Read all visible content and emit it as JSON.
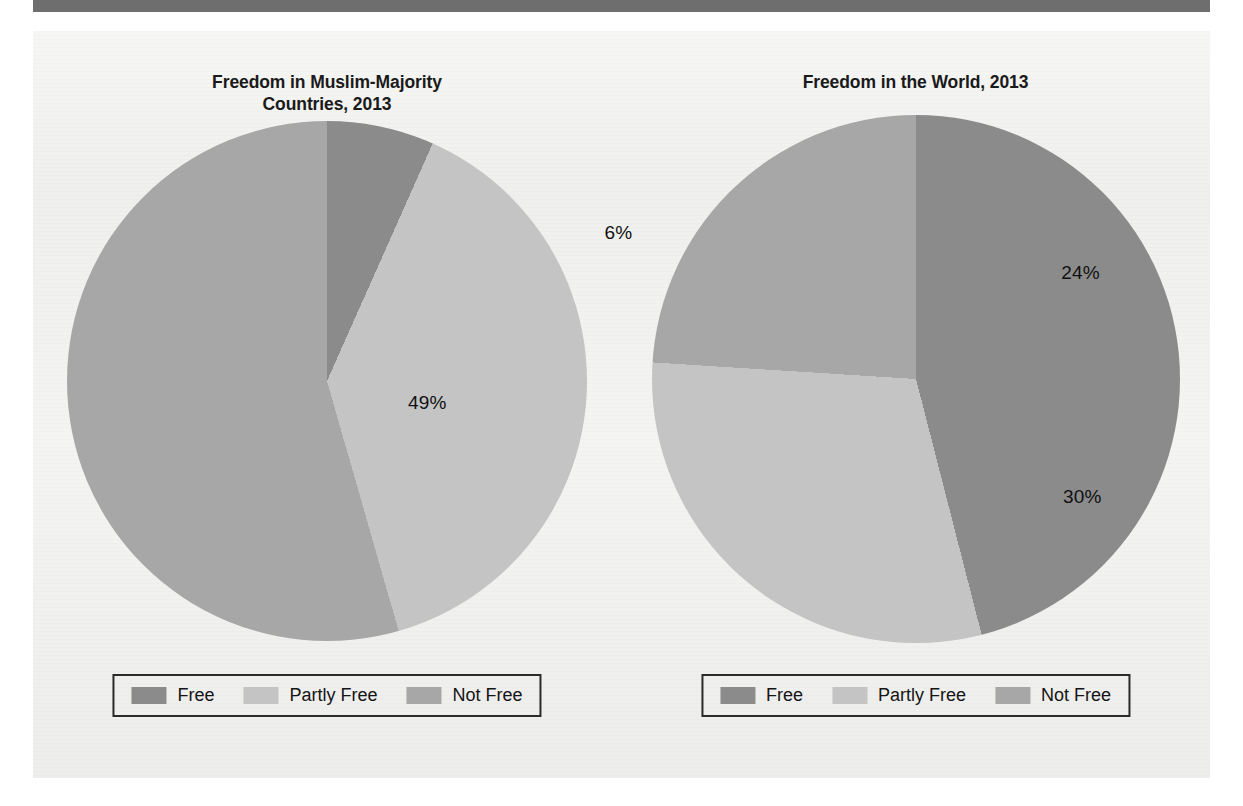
{
  "page": {
    "background_color": "#ffffff",
    "panel_color": "#f2f2f0",
    "top_rule_color": "#6e6e6e"
  },
  "palette": {
    "free": "#8b8b8b",
    "partly_free": "#c4c4c4",
    "not_free": "#a7a7a7",
    "label_text": "#111111",
    "title_text": "#1a1a1a",
    "legend_border": "#2a2a2a"
  },
  "legend": {
    "items": [
      {
        "label": "Free",
        "color": "#8b8b8b",
        "key": "free"
      },
      {
        "label": "Partly Free",
        "color": "#c4c4c4",
        "key": "partly_free"
      },
      {
        "label": "Not Free",
        "color": "#a7a7a7",
        "key": "not_free"
      }
    ]
  },
  "charts": [
    {
      "id": "muslim-majority",
      "title": "Freedom in Muslim-Majority Countries, 2013",
      "title_line1": "Freedom in Muslim-Majority",
      "title_line2": "Countries, 2013",
      "labels": {
        "free": "6%",
        "partly_free": "35%",
        "not_free": "49%"
      }
    },
    {
      "id": "world",
      "title": "Freedom in the World, 2013",
      "title_line1": "Freedom in the World, 2013",
      "title_line2": "",
      "labels": {
        "free": "46%",
        "partly_free": "30%",
        "not_free": "24%"
      }
    }
  ],
  "chart_data": [
    {
      "type": "pie",
      "title": "Freedom in Muslim-Majority Countries, 2013",
      "categories": [
        "Free",
        "Partly Free",
        "Not Free"
      ],
      "values": [
        6,
        35,
        49
      ],
      "value_labels": [
        "6%",
        "35%",
        "49%"
      ],
      "unit": "percent",
      "colors": [
        "#8b8b8b",
        "#c4c4c4",
        "#a7a7a7"
      ],
      "start_angle_deg": 0,
      "direction": "clockwise",
      "legend": "bottom",
      "note": "Percentages as printed sum to 90%; remaining share unlabeled in source figure."
    },
    {
      "type": "pie",
      "title": "Freedom in the World, 2013",
      "categories": [
        "Free",
        "Partly Free",
        "Not Free"
      ],
      "values": [
        46,
        30,
        24
      ],
      "value_labels": [
        "46%",
        "30%",
        "24%"
      ],
      "unit": "percent",
      "colors": [
        "#8b8b8b",
        "#c4c4c4",
        "#a7a7a7"
      ],
      "start_angle_deg": 0,
      "direction": "clockwise",
      "legend": "bottom"
    }
  ]
}
